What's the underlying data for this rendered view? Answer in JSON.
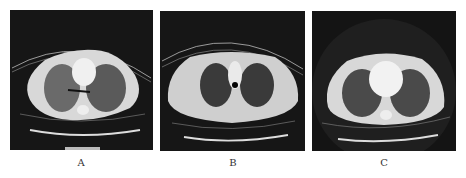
{
  "figure": {
    "panels": [
      {
        "id": "A",
        "label": "A",
        "description": "Axial chest CT, lung window, bilateral ground-glass opacities with air bronchogram"
      },
      {
        "id": "B",
        "label": "B",
        "description": "Axial chest CT, lung window, clear lung fields with trachea"
      },
      {
        "id": "C",
        "label": "C",
        "description": "Axial chest CT, lung window, level of heart and hilum"
      }
    ]
  }
}
